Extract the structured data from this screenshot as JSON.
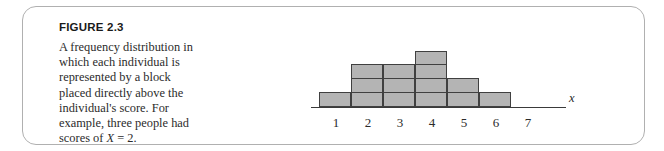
{
  "figure": {
    "label": "FIGURE 2.3",
    "caption_line1": "A frequency distribution in which each individual is represented by a block placed directly above the individual's score. For example, three people had scores of ",
    "caption_var": "X",
    "caption_line2": " = 2.",
    "border_color": "#b0b0b0"
  },
  "chart_data": {
    "type": "bar",
    "title": "",
    "subtitle": "",
    "xlabel": "x",
    "ylabel": "",
    "categories": [
      "1",
      "2",
      "3",
      "4",
      "5",
      "6",
      "7"
    ],
    "values": [
      1,
      3,
      3,
      4,
      2,
      1,
      0
    ],
    "tick_labels": [
      "1",
      "2",
      "3",
      "4",
      "5",
      "6",
      "7"
    ],
    "ylim": [
      0,
      4
    ],
    "grid": false,
    "legend": null,
    "block_fill_color": "#b4b4b4",
    "block_border_color": "#404040",
    "axis_color": "#3a3a3a",
    "note": "Each block represents one individual; block stacks show frequency per score."
  }
}
